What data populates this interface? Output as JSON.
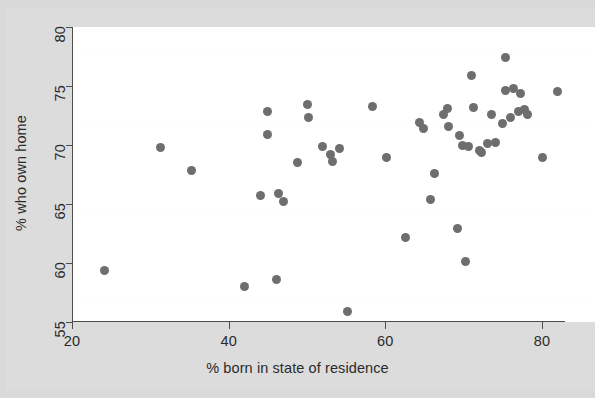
{
  "figure": {
    "background_color": "#d9d9d9",
    "plot_background_color": "#ffffff",
    "axis_color": "#4d4d4d",
    "point_color": "#6e6e6e"
  },
  "chart_data": {
    "type": "scatter",
    "title": "",
    "xlabel": "% born in state of residence",
    "ylabel": "% who own home",
    "xlim": [
      20,
      82.5
    ],
    "ylim": [
      54.0,
      80.0
    ],
    "xticks": [
      "20",
      "40",
      "60",
      "80"
    ],
    "xtick_values": [
      20,
      40,
      60,
      80
    ],
    "yticks": [
      "55",
      "60",
      "65",
      "70",
      "75",
      "80"
    ],
    "ytick_values": [
      55,
      60,
      65,
      70,
      75,
      80
    ],
    "grid": false,
    "legend": false,
    "marker": "filled-circle",
    "marker_size_px": 9,
    "n_points": 51,
    "points": [
      [
        24.2,
        59.4
      ],
      [
        31.3,
        69.8
      ],
      [
        35.3,
        67.8
      ],
      [
        42.0,
        58.0
      ],
      [
        44.0,
        65.7
      ],
      [
        44.9,
        70.9
      ],
      [
        45.0,
        72.8
      ],
      [
        46.1,
        58.6
      ],
      [
        46.4,
        65.9
      ],
      [
        47.0,
        65.2
      ],
      [
        48.8,
        68.5
      ],
      [
        50.1,
        73.4
      ],
      [
        50.2,
        72.3
      ],
      [
        52.0,
        69.9
      ],
      [
        53.0,
        69.2
      ],
      [
        53.3,
        68.6
      ],
      [
        54.2,
        69.7
      ],
      [
        55.2,
        55.9
      ],
      [
        58.3,
        73.3
      ],
      [
        60.2,
        68.9
      ],
      [
        62.6,
        62.2
      ],
      [
        64.4,
        71.9
      ],
      [
        64.9,
        71.4
      ],
      [
        65.8,
        65.4
      ],
      [
        66.3,
        67.6
      ],
      [
        67.4,
        72.6
      ],
      [
        67.9,
        73.1
      ],
      [
        68.0,
        71.6
      ],
      [
        69.2,
        62.9
      ],
      [
        69.5,
        70.8
      ],
      [
        69.8,
        70.0
      ],
      [
        70.2,
        60.1
      ],
      [
        70.6,
        69.9
      ],
      [
        71.0,
        75.9
      ],
      [
        71.2,
        73.2
      ],
      [
        72.0,
        69.5
      ],
      [
        72.3,
        69.4
      ],
      [
        73.0,
        70.1
      ],
      [
        73.5,
        72.6
      ],
      [
        74.0,
        70.2
      ],
      [
        75.0,
        71.8
      ],
      [
        75.3,
        77.4
      ],
      [
        75.4,
        74.6
      ],
      [
        76.0,
        72.3
      ],
      [
        76.3,
        74.8
      ],
      [
        77.0,
        72.8
      ],
      [
        77.2,
        74.4
      ],
      [
        77.8,
        73.0
      ],
      [
        78.2,
        72.6
      ],
      [
        80.1,
        68.9
      ],
      [
        82.0,
        74.5
      ]
    ]
  }
}
